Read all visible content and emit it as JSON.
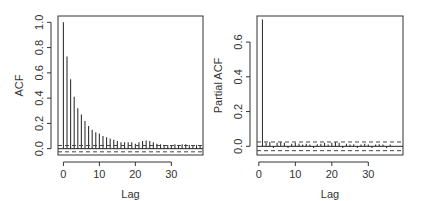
{
  "chart_data": [
    {
      "type": "bar",
      "subtype": "acf-stem",
      "title": "",
      "xlabel": "Lag",
      "ylabel": "ACF",
      "xlim": [
        -1.5,
        38.8
      ],
      "ylim": [
        -0.05,
        1.05
      ],
      "xticks": [
        0,
        10,
        20,
        30
      ],
      "xtick_labels": [
        "0",
        "10",
        "20",
        "30"
      ],
      "yticks": [
        0.0,
        0.2,
        0.4,
        0.6,
        0.8,
        1.0
      ],
      "ytick_labels": [
        "0.0",
        "0.2",
        "0.4",
        "0.6",
        "0.8",
        "1.0"
      ],
      "grid": false,
      "confidence_band": 0.025,
      "x": [
        0,
        1,
        2,
        3,
        4,
        5,
        6,
        7,
        8,
        9,
        10,
        11,
        12,
        13,
        14,
        15,
        16,
        17,
        18,
        19,
        20,
        21,
        22,
        23,
        24,
        25,
        26,
        27,
        28,
        29,
        30,
        31,
        32,
        33,
        34,
        35,
        36,
        37,
        38
      ],
      "values": [
        1.0,
        0.73,
        0.55,
        0.41,
        0.32,
        0.27,
        0.22,
        0.18,
        0.15,
        0.13,
        0.12,
        0.1,
        0.09,
        0.08,
        0.07,
        0.06,
        0.05,
        0.05,
        0.05,
        0.05,
        0.04,
        0.05,
        0.06,
        0.065,
        0.06,
        0.05,
        0.04,
        0.035,
        0.03,
        0.03,
        0.03,
        0.035,
        0.03,
        0.035,
        0.035,
        0.03,
        0.03,
        0.03,
        0.03
      ]
    },
    {
      "type": "bar",
      "subtype": "pacf-stem",
      "title": "",
      "xlabel": "Lag",
      "ylabel": "Partial ACF",
      "xlim": [
        -0.5,
        39.5
      ],
      "ylim": [
        -0.05,
        0.75
      ],
      "xticks": [
        0,
        10,
        20,
        30
      ],
      "xtick_labels": [
        "0",
        "10",
        "20",
        "30"
      ],
      "yticks": [
        0.0,
        0.2,
        0.4,
        0.6
      ],
      "ytick_labels": [
        "0.0",
        "0.2",
        "0.4",
        "0.6"
      ],
      "grid": false,
      "confidence_band": 0.025,
      "x": [
        1,
        2,
        3,
        4,
        5,
        6,
        7,
        8,
        9,
        10,
        11,
        12,
        13,
        14,
        15,
        16,
        17,
        18,
        19,
        20,
        21,
        22,
        23,
        24,
        25,
        26,
        27,
        28,
        29,
        30,
        31,
        32,
        33,
        34,
        35,
        36
      ],
      "values": [
        0.73,
        0.02,
        0.025,
        -0.01,
        0.02,
        0.025,
        0.02,
        -0.01,
        0.015,
        0.02,
        0.015,
        0.01,
        0.015,
        0.01,
        -0.01,
        0.012,
        0.015,
        0.02,
        0.01,
        0.02,
        0.025,
        0.02,
        -0.01,
        0.015,
        0.01,
        0.012,
        -0.01,
        0.01,
        0.015,
        0.01,
        -0.01,
        0.01,
        0.012,
        0.01,
        -0.01,
        0.01
      ]
    }
  ],
  "panels": [
    {
      "ylabel": "ACF",
      "xlabel": "Lag"
    },
    {
      "ylabel": "Partial ACF",
      "xlabel": "Lag"
    }
  ]
}
